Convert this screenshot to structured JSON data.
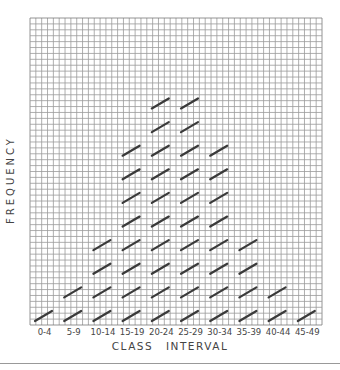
{
  "chart_data": {
    "type": "bar",
    "style": "tally-marks-on-grid-paper",
    "title": "",
    "xlabel": "CLASS INTERVAL",
    "ylabel": "FREQUENCY",
    "categories": [
      "0-4",
      "5-9",
      "10-14",
      "15-19",
      "20-24",
      "25-29",
      "30-34",
      "35-39",
      "40-44",
      "45-49"
    ],
    "values": [
      1,
      2,
      4,
      8,
      10,
      10,
      8,
      4,
      2,
      1
    ],
    "ylim": [
      0,
      13
    ],
    "grid": true,
    "legend": null
  },
  "colors": {
    "grid": "#9a9a9a",
    "grid_border": "#7a7a7a",
    "tally": "#3a3a3a",
    "text": "#444444",
    "separator": "#999999"
  }
}
